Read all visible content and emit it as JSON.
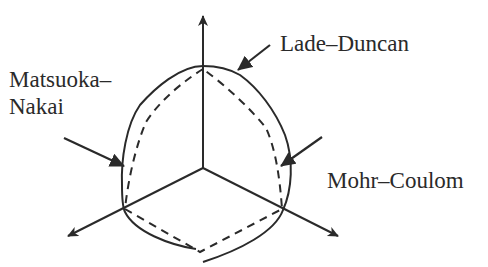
{
  "diagram": {
    "type": "deviatoric-plane-yield-surfaces",
    "labels": {
      "lade_duncan": "Lade–Duncan",
      "matsuoka_line1": "Matsuoka–",
      "matsuoka_line2": "Nakai",
      "mohr_coulomb": "Mohr–Coulom"
    },
    "axes": {
      "count": 3,
      "origin": [
        203,
        168
      ],
      "tips": [
        [
          203,
          16
        ],
        [
          68,
          236
        ],
        [
          338,
          236
        ]
      ]
    },
    "curves": [
      {
        "name": "Lade–Duncan",
        "style": "solid"
      },
      {
        "name": "Matsuoka–Nakai",
        "style": "solid"
      },
      {
        "name": "Mohr–Coulomb",
        "style": "dashed"
      }
    ],
    "colors": {
      "stroke": "#2a2a2a",
      "background": "#ffffff"
    }
  }
}
